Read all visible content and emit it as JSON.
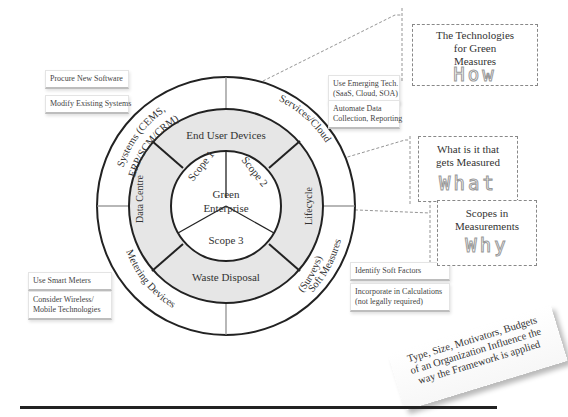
{
  "diagram": {
    "center_label": [
      "Green",
      "Enterprise"
    ],
    "scopes": [
      {
        "id": "scope1",
        "label": "Scope 1"
      },
      {
        "id": "scope2",
        "label": "Scope 2"
      },
      {
        "id": "scope3",
        "label": "Scope 3"
      }
    ],
    "middle_ring": [
      {
        "id": "end-user-devices",
        "label": "End User Devices"
      },
      {
        "id": "lifecycle",
        "label": "Lifecycle"
      },
      {
        "id": "waste-disposal",
        "label": "Waste Disposal"
      },
      {
        "id": "data-centre",
        "label": "Data Centre"
      }
    ],
    "outer_ring": [
      {
        "id": "systems",
        "label_line1": "Systems (CEMS,",
        "label_line2": "ERP/SCM/CRM)"
      },
      {
        "id": "services-cloud",
        "label_line1": "Services/Cloud"
      },
      {
        "id": "soft-measures",
        "label_line1": "Soft Measures",
        "label_line2": "(Surveys)"
      },
      {
        "id": "metering-devices",
        "label_line1": "Metering Devices"
      }
    ],
    "colors": {
      "ring_line": "#222222",
      "middle_fill": "#e6e6e6",
      "divider": "#888888",
      "dashed": "#888888"
    }
  },
  "notes": {
    "systems": [
      "Procure New Software",
      "Modify Existing Systems"
    ],
    "services": [
      [
        "Use Emerging Tech.",
        "(SaaS, Cloud, SOA)"
      ],
      [
        "Automate Data",
        "Collection, Reporting"
      ]
    ],
    "metering": [
      [
        "Use Smart Meters"
      ],
      [
        "Consider Wireless/",
        "Mobile Technologies"
      ]
    ],
    "soft": [
      [
        "Identify Soft Factors"
      ],
      [
        "Incorporate in Calculations",
        "(not legally required)"
      ]
    ]
  },
  "callouts": {
    "how": {
      "lines": [
        "The Technologies",
        "for Green",
        "Measures"
      ],
      "word": "How"
    },
    "what": {
      "lines": [
        "What is it that",
        "gets Measured"
      ],
      "word": "What"
    },
    "why": {
      "lines": [
        "Scopes in",
        "Measurements"
      ],
      "word": "Why"
    }
  },
  "slab": {
    "lines": [
      "Type, Size, Motivators, Budgets",
      "of an Organization Influence the",
      "way the Framework is applied"
    ]
  }
}
